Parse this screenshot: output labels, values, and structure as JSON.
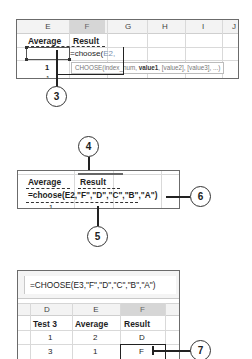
{
  "panel1": {
    "column_headers": [
      "E",
      "F",
      "G",
      "H",
      "I",
      "J"
    ],
    "selected_column": "F",
    "header_row": {
      "E": "Average",
      "F": "Result"
    },
    "editing_cell_text": "=choose(",
    "editing_cell_ref": "E2,",
    "row3_value": "1",
    "row4_value": "1",
    "tooltip": {
      "fn": "CHOOSE(",
      "arg1": "index_num, ",
      "arg2": "value1",
      "rest": ", [value2], [value3], ...)"
    },
    "callout": "3"
  },
  "panel2": {
    "header_row": {
      "E": "Average",
      "F": "Result"
    },
    "formula": "=choose(E2,\"F\",\"D\",\"C\",\"B\",\"A\")",
    "row3_value": "1",
    "callouts": {
      "top": "4",
      "bottom": "5",
      "right": "6"
    }
  },
  "panel3": {
    "formula_bar": "=CHOOSE(E3,\"F\",\"D\",\"C\",\"B\",\"A\")",
    "column_headers": [
      "D",
      "E",
      "F"
    ],
    "selected_column": "F",
    "rows": [
      [
        "Test 3",
        "Average",
        "Result"
      ],
      [
        "1",
        "2",
        "D"
      ],
      [
        "3",
        "1",
        "F"
      ]
    ],
    "callout": "7"
  }
}
